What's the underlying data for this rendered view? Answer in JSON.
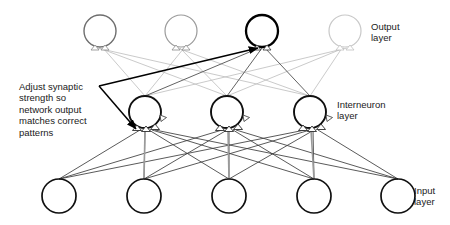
{
  "diagram": {
    "labels": {
      "output_layer": "Output\nlayer",
      "interneuron_layer": "Interneuron\nlayer",
      "input_layer": "Input\nlayer",
      "annotation": "Adjust synaptic\nstrength so\nnetwork output\nmatches correct\npatterns"
    },
    "colors": {
      "highlight": "#000000",
      "node_stroke_dark": "#111111",
      "node_stroke_mid": "#6e6e6e",
      "node_stroke_faint": "#c8c8c8",
      "edge_dark": "#3c3c3c",
      "edge_mid": "#8c8c8c",
      "edge_faint": "#cccccc",
      "background": "#ffffff"
    },
    "layers": [
      {
        "name": "output",
        "label": "Output layer",
        "node_radius": 16,
        "nodes": [
          {
            "id": "o1",
            "cx": 100,
            "cy": 31,
            "stroke": "#6e6e6e",
            "width": 1.4,
            "highlight": false
          },
          {
            "id": "o2",
            "cx": 181,
            "cy": 31,
            "stroke": "#9a9a9a",
            "width": 1.2,
            "highlight": false
          },
          {
            "id": "o3",
            "cx": 262,
            "cy": 31,
            "stroke": "#000000",
            "width": 2.3,
            "highlight": true
          },
          {
            "id": "o4",
            "cx": 345,
            "cy": 31,
            "stroke": "#c8c8c8",
            "width": 1.2,
            "highlight": false
          }
        ]
      },
      {
        "name": "interneuron",
        "label": "Interneuron layer",
        "node_radius": 16,
        "nodes": [
          {
            "id": "h1",
            "cx": 145,
            "cy": 112,
            "stroke": "#101010",
            "width": 1.9,
            "highlight": false
          },
          {
            "id": "h2",
            "cx": 227,
            "cy": 112,
            "stroke": "#101010",
            "width": 1.9,
            "highlight": false
          },
          {
            "id": "h3",
            "cx": 310,
            "cy": 112,
            "stroke": "#101010",
            "width": 1.9,
            "highlight": false
          }
        ]
      },
      {
        "name": "input",
        "label": "Input layer",
        "node_radius": 17,
        "nodes": [
          {
            "id": "i1",
            "cx": 59,
            "cy": 196,
            "stroke": "#101010",
            "width": 1.7,
            "highlight": false
          },
          {
            "id": "i2",
            "cx": 144,
            "cy": 196,
            "stroke": "#101010",
            "width": 1.7,
            "highlight": false
          },
          {
            "id": "i3",
            "cx": 229,
            "cy": 196,
            "stroke": "#101010",
            "width": 1.7,
            "highlight": false
          },
          {
            "id": "i4",
            "cx": 314,
            "cy": 196,
            "stroke": "#101010",
            "width": 1.7,
            "highlight": false
          },
          {
            "id": "i5",
            "cx": 398,
            "cy": 196,
            "stroke": "#101010",
            "width": 1.7,
            "highlight": false
          }
        ]
      }
    ],
    "counts": {
      "output_nodes": 4,
      "interneuron_nodes": 3,
      "input_nodes": 5
    },
    "annotation_arrows": [
      {
        "id": "arrow-to-output",
        "x1": 99,
        "y1": 86,
        "x2": 261,
        "y2": 48,
        "target": "o3"
      },
      {
        "id": "arrow-to-interneuron",
        "x1": 99,
        "y1": 86,
        "x2": 137,
        "y2": 130,
        "target": "h1"
      }
    ]
  }
}
